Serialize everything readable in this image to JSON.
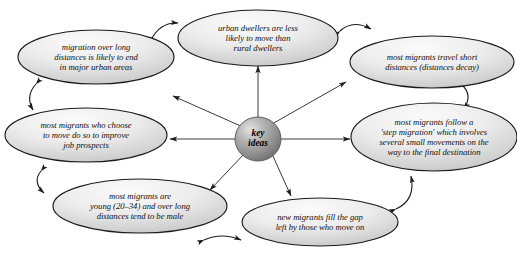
{
  "diagram": {
    "type": "mind-map",
    "title_fragment_cropped": "",
    "center": {
      "label_line1": "key",
      "label_line2": "ideas",
      "shape": "sphere",
      "fill_color": "#8e8e8e",
      "highlight_color": "#d6d6d6"
    },
    "node_style": {
      "shape": "ellipse",
      "fill_top_color": "#f2f2f2",
      "fill_bottom_color": "#b9b9b9",
      "stroke_color": "#1a1a1a"
    },
    "nodes": [
      {
        "id": "urban-dwellers",
        "lines": [
          "urban dwellers are less",
          "likely to move than",
          "rural dwellers"
        ]
      },
      {
        "id": "short-distances",
        "lines": [
          "most migrants travel short",
          "distances (distances decay)"
        ]
      },
      {
        "id": "step-migration",
        "lines": [
          "most migrants follow a",
          "'step migration' which involves",
          "several small movements on the",
          "way to the final destination"
        ]
      },
      {
        "id": "fill-the-gap",
        "lines": [
          "new migrants fill the gap",
          "left by those who move on"
        ]
      },
      {
        "id": "young-male",
        "lines": [
          "most migrants are",
          "young (20–34) and over long",
          "distances tend to be male"
        ]
      },
      {
        "id": "job-prospects",
        "lines": [
          "most migrants who choose",
          "to move do so to improve",
          "job prospects"
        ]
      },
      {
        "id": "long-distance-urban",
        "lines": [
          "migration over long",
          "distances is likely to end",
          "in major urban areas"
        ]
      }
    ],
    "spokes": [
      {
        "id": "spoke-to-urban-dwellers",
        "target": "urban-dwellers"
      },
      {
        "id": "spoke-to-short-distances",
        "target": "short-distances"
      },
      {
        "id": "spoke-to-step-migration",
        "target": "step-migration"
      },
      {
        "id": "spoke-to-fill-the-gap",
        "target": "fill-the-gap"
      },
      {
        "id": "spoke-to-young-male",
        "target": "young-male"
      },
      {
        "id": "spoke-to-job-prospects",
        "target": "job-prospects"
      },
      {
        "id": "spoke-to-long-distance-urban",
        "target": "long-distance-urban"
      }
    ],
    "connectors": [
      {
        "id": "connector-urban-to-longdistance",
        "style": "double-headed-curved"
      },
      {
        "id": "connector-urban-to-shortdistances",
        "style": "double-headed-curved"
      },
      {
        "id": "connector-longdistance-to-jobprospects",
        "style": "double-headed-curved"
      },
      {
        "id": "connector-shortdistances-to-stepmigration",
        "style": "double-headed-curved"
      },
      {
        "id": "connector-jobprospects-to-youngmale",
        "style": "double-headed-curved"
      },
      {
        "id": "connector-youngmale-to-fillthegap",
        "style": "double-headed-curved"
      },
      {
        "id": "connector-fillthegap-to-stepmigration",
        "style": "double-headed-curved"
      }
    ]
  }
}
